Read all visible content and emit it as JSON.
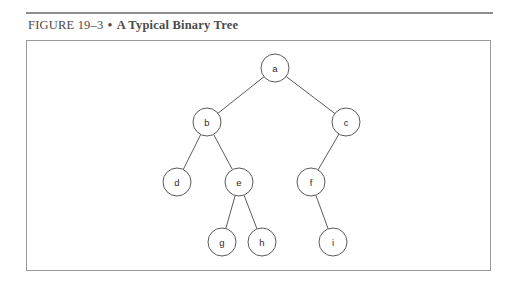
{
  "figure": {
    "caption_label": "FIGURE",
    "caption_number": "19–3",
    "caption_separator": "•",
    "caption_title": "A Typical Binary Tree",
    "rule_color": "#8d8d8d",
    "box_border_color": "#9a9a9a",
    "background_color": "#ffffff"
  },
  "diagram": {
    "type": "binary-tree",
    "node_radius": 14,
    "node_stroke_color": "#5b5b5b",
    "node_fill_color": "#ffffff",
    "edge_color": "#5b5b5b",
    "nodes": [
      {
        "id": "a",
        "label": "a",
        "x": 275,
        "y": 68
      },
      {
        "id": "b",
        "label": "b",
        "x": 207,
        "y": 122
      },
      {
        "id": "c",
        "label": "c",
        "x": 346,
        "y": 122
      },
      {
        "id": "d",
        "label": "d",
        "x": 177,
        "y": 182
      },
      {
        "id": "e",
        "label": "e",
        "x": 239,
        "y": 182
      },
      {
        "id": "f",
        "label": "f",
        "x": 311,
        "y": 182
      },
      {
        "id": "g",
        "label": "g",
        "x": 222,
        "y": 242
      },
      {
        "id": "h",
        "label": "h",
        "x": 262,
        "y": 242
      },
      {
        "id": "i",
        "label": "i",
        "x": 333,
        "y": 242
      }
    ],
    "edges": [
      {
        "from": "a",
        "to": "b",
        "side": "left"
      },
      {
        "from": "a",
        "to": "c",
        "side": "right"
      },
      {
        "from": "b",
        "to": "d",
        "side": "left"
      },
      {
        "from": "b",
        "to": "e",
        "side": "right"
      },
      {
        "from": "c",
        "to": "f",
        "side": "left"
      },
      {
        "from": "e",
        "to": "g",
        "side": "left"
      },
      {
        "from": "e",
        "to": "h",
        "side": "right"
      },
      {
        "from": "f",
        "to": "i",
        "side": "right"
      }
    ]
  }
}
